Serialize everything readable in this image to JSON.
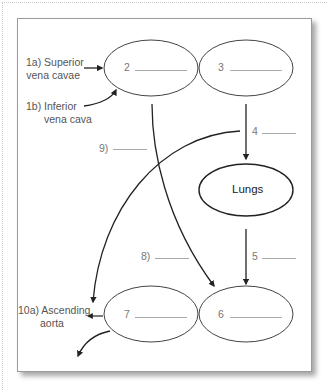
{
  "diagram": {
    "title": "",
    "nodes": {
      "node2": {
        "number": "2"
      },
      "node3": {
        "number": "3"
      },
      "lungs": {
        "label": "Lungs"
      },
      "node6": {
        "number": "6"
      },
      "node7": {
        "number": "7"
      }
    },
    "inputs": {
      "superior": {
        "line1": "1a) Superior",
        "line2": "vena cavae"
      },
      "inferior": {
        "line1": "1b) Inferior",
        "line2": "vena cava"
      }
    },
    "outputs": {
      "ascending": {
        "line1": "10a) Ascending",
        "line2": "aorta"
      }
    },
    "vessel_labels": {
      "v4": "4",
      "v5": "5",
      "v8": "8)",
      "v9": "9)"
    }
  }
}
